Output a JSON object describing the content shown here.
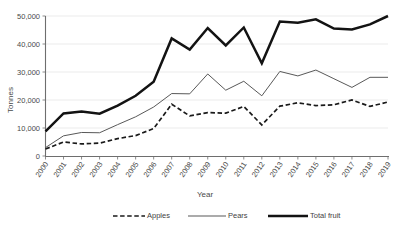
{
  "chart_data": {
    "type": "line",
    "title": "",
    "xlabel": "Year",
    "ylabel": "Tonnes",
    "categories": [
      "2000",
      "2001",
      "2002",
      "2003",
      "2004",
      "2005",
      "2006",
      "2007",
      "2008",
      "2009",
      "2010",
      "2011",
      "2012",
      "2013",
      "2014",
      "2015",
      "2016",
      "2017",
      "2018",
      "2019"
    ],
    "ylim": [
      0,
      50000
    ],
    "ytick_labels": [
      "0",
      "10,000",
      "20,000",
      "30,000",
      "40,000",
      "50,000"
    ],
    "ytick_values": [
      0,
      10000,
      20000,
      30000,
      40000,
      50000
    ],
    "grid": true,
    "legend_position": "bottom",
    "series": [
      {
        "name": "Apples",
        "style": "dashed",
        "color": "#1a1a1a",
        "values": [
          2500,
          5000,
          4300,
          4600,
          6200,
          7300,
          9800,
          18500,
          14300,
          15500,
          15300,
          17700,
          11100,
          17800,
          19000,
          18000,
          18300,
          20000,
          17700,
          19300
        ]
      },
      {
        "name": "Pears",
        "style": "solid-thin",
        "color": "#4f4f4f",
        "values": [
          3000,
          7200,
          8400,
          8300,
          11200,
          14000,
          17500,
          22300,
          22200,
          29300,
          23500,
          26700,
          21500,
          30200,
          28600,
          30700,
          27600,
          24500,
          28100,
          28100
        ]
      },
      {
        "name": "Total fruit",
        "style": "solid-thick",
        "color": "#131313",
        "values": [
          8800,
          15200,
          15900,
          15100,
          18000,
          21500,
          26500,
          42000,
          38000,
          45700,
          39500,
          45900,
          33100,
          48000,
          47600,
          48800,
          45500,
          45200,
          47000,
          50000
        ]
      }
    ],
    "legend_items": [
      {
        "label": "Apples",
        "style": "dashed"
      },
      {
        "label": "Pears",
        "style": "solid-thin"
      },
      {
        "label": "Total fruit",
        "style": "solid-thick"
      }
    ]
  }
}
